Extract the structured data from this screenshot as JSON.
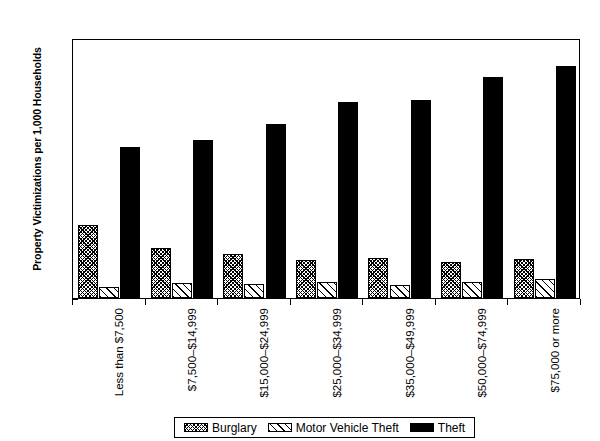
{
  "chart_data": {
    "type": "bar",
    "title": "",
    "subtitle": "",
    "xlabel": "",
    "ylabel": "Property Victimizations per 1,000 Households",
    "ylim": [
      0,
      350
    ],
    "ytick_step": 50,
    "yminor_step": 10,
    "ytick_labels": [
      "0",
      "50",
      "100",
      "150",
      "200",
      "250",
      "300",
      "350"
    ],
    "ytick_values": [
      0,
      50,
      100,
      150,
      200,
      250,
      300,
      350
    ],
    "grid": false,
    "legend_position": "bottom",
    "categories": [
      "Less than $7,500",
      "$7,500–$14,999",
      "$15,000–$24,999",
      "$25,000–$34,999",
      "$35,000–$49,999",
      "$50,000–$74,999",
      "$75,000 or more"
    ],
    "series": [
      {
        "name": "Burglary",
        "pattern": "dense-crosshatch",
        "color": "#000000",
        "values": [
          98,
          67,
          59,
          51,
          54,
          49,
          52
        ]
      },
      {
        "name": "Motor Vehicle Theft",
        "pattern": "diagonal-hatch",
        "color": "#000000",
        "values": [
          15,
          20,
          19,
          21,
          18,
          22,
          26
        ]
      },
      {
        "name": "Theft",
        "pattern": "solid",
        "color": "#000000",
        "values": [
          203,
          213,
          234,
          264,
          267,
          298,
          313
        ]
      }
    ]
  },
  "axis": {
    "y_title": "Property Victimizations per 1,000 Households"
  },
  "legend": {
    "items": [
      {
        "label": "Burglary",
        "swatch": "burglary"
      },
      {
        "label": "Motor Vehicle Theft",
        "swatch": "mvt"
      },
      {
        "label": "Theft",
        "swatch": "theft"
      }
    ]
  }
}
